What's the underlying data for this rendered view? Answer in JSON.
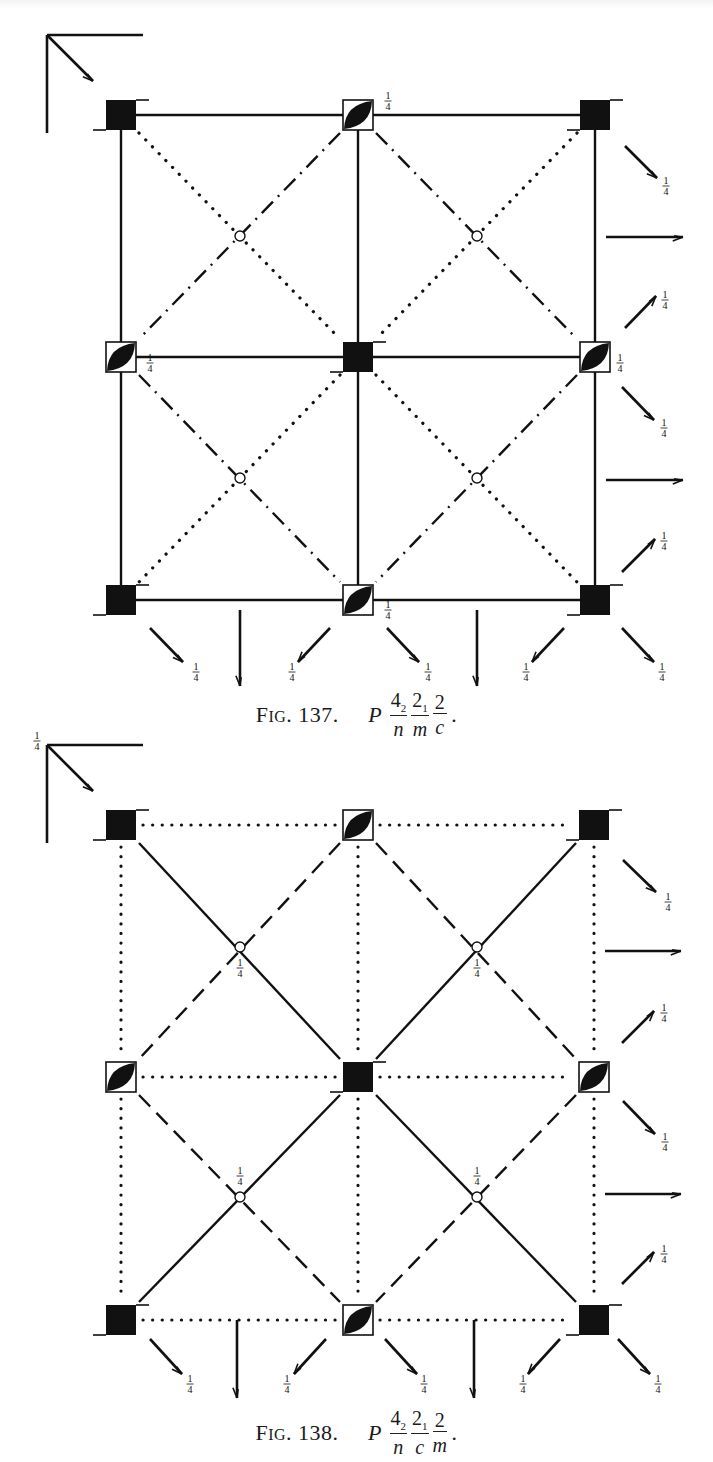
{
  "figures": [
    {
      "id": "fig137",
      "label_prefix": "F",
      "label_smallcaps": "IG",
      "label_number": ". 137.",
      "symbol": {
        "lattice": "P",
        "parts": [
          {
            "num": "4",
            "sub": "2",
            "den": "n"
          },
          {
            "num": "2",
            "sub": "1",
            "den": "m"
          },
          {
            "num": "2",
            "sub": "",
            "den": "c"
          }
        ],
        "trail": "."
      },
      "space_group": "P 4_2/n 2_1/m 2/c",
      "svg_top": 0,
      "caption_top": 690,
      "grid": {
        "xs": [
          121,
          358,
          595
        ],
        "ys": [
          115,
          357,
          600
        ]
      },
      "axis_origin": [
        47,
        35
      ],
      "axis_label": "",
      "boundary_style": "solid",
      "mid_style": "solid",
      "diag_main_style": "dotted",
      "diag_anti_style": "dashdot",
      "inversion_centers": [
        [
          240,
          236
        ],
        [
          477,
          236
        ],
        [
          240,
          478
        ],
        [
          477,
          478
        ]
      ],
      "inversion_labels": [],
      "diad_labels": [
        {
          "x": 388,
          "y": 101,
          "text": "1/4"
        },
        {
          "x": 150,
          "y": 363,
          "text": "1/4"
        },
        {
          "x": 620,
          "y": 363,
          "text": "1/4"
        },
        {
          "x": 388,
          "y": 610,
          "text": "1/4"
        }
      ],
      "side_arrows": [
        {
          "x1": 625,
          "y1": 146,
          "x2": 657,
          "y2": 178,
          "label": "1/4",
          "lx": 666,
          "ly": 186
        },
        {
          "x1": 606,
          "y1": 237,
          "x2": 683,
          "y2": 237,
          "label": "",
          "lx": 0,
          "ly": 0
        },
        {
          "x1": 625,
          "y1": 328,
          "x2": 656,
          "y2": 296,
          "label": "1/4",
          "lx": 665,
          "ly": 300
        },
        {
          "x1": 622,
          "y1": 387,
          "x2": 654,
          "y2": 420,
          "label": "1/4",
          "lx": 664,
          "ly": 428
        },
        {
          "x1": 606,
          "y1": 480,
          "x2": 683,
          "y2": 480,
          "label": "",
          "lx": 0,
          "ly": 0
        },
        {
          "x1": 622,
          "y1": 572,
          "x2": 655,
          "y2": 539,
          "label": "1/4",
          "lx": 664,
          "ly": 541
        }
      ],
      "bottom_arrows": [
        {
          "x1": 150,
          "y1": 628,
          "x2": 183,
          "y2": 662,
          "label": "1/4",
          "lx": 196,
          "ly": 672
        },
        {
          "x1": 240,
          "y1": 610,
          "x2": 240,
          "y2": 686,
          "label": "",
          "lx": 0,
          "ly": 0
        },
        {
          "x1": 330,
          "y1": 628,
          "x2": 298,
          "y2": 662,
          "label": "1/4",
          "lx": 292,
          "ly": 672
        },
        {
          "x1": 387,
          "y1": 628,
          "x2": 419,
          "y2": 662,
          "label": "1/4",
          "lx": 428,
          "ly": 672
        },
        {
          "x1": 477,
          "y1": 610,
          "x2": 477,
          "y2": 686,
          "label": "",
          "lx": 0,
          "ly": 0
        },
        {
          "x1": 564,
          "y1": 628,
          "x2": 532,
          "y2": 662,
          "label": "1/4",
          "lx": 526,
          "ly": 672
        },
        {
          "x1": 622,
          "y1": 628,
          "x2": 654,
          "y2": 662,
          "label": "1/4",
          "lx": 662,
          "ly": 672
        }
      ]
    },
    {
      "id": "fig138",
      "label_prefix": "F",
      "label_smallcaps": "IG",
      "label_number": ". 138.",
      "symbol": {
        "lattice": "P",
        "parts": [
          {
            "num": "4",
            "sub": "2",
            "den": "n"
          },
          {
            "num": "2",
            "sub": "1",
            "den": "c"
          },
          {
            "num": "2",
            "sub": "",
            "den": "m"
          }
        ],
        "trail": "."
      },
      "space_group": "P 4_2/n 2_1/c 2/m",
      "svg_top": 0,
      "caption_top": 1408,
      "grid": {
        "xs": [
          121,
          358,
          594
        ],
        "ys": [
          825,
          1077,
          1320
        ]
      },
      "axis_origin": [
        47,
        745
      ],
      "axis_label": "1/4",
      "boundary_style": "dotted",
      "mid_style": "dotted",
      "diag_main_style": "solid",
      "diag_anti_style": "dashed",
      "inversion_centers": [
        [
          240,
          947
        ],
        [
          477,
          947
        ],
        [
          240,
          1197
        ],
        [
          477,
          1197
        ]
      ],
      "inversion_labels": [
        {
          "x": 240,
          "y": 968,
          "text": "1/4"
        },
        {
          "x": 477,
          "y": 968,
          "text": "1/4"
        },
        {
          "x": 240,
          "y": 1176,
          "text": "1/4"
        },
        {
          "x": 477,
          "y": 1176,
          "text": "1/4"
        }
      ],
      "diad_labels": [],
      "side_arrows": [
        {
          "x1": 623,
          "y1": 860,
          "x2": 656,
          "y2": 892,
          "label": "1/4",
          "lx": 668,
          "ly": 902
        },
        {
          "x1": 605,
          "y1": 951,
          "x2": 681,
          "y2": 951,
          "label": "",
          "lx": 0,
          "ly": 0
        },
        {
          "x1": 622,
          "y1": 1043,
          "x2": 654,
          "y2": 1011,
          "label": "1/4",
          "lx": 664,
          "ly": 1013
        },
        {
          "x1": 623,
          "y1": 1101,
          "x2": 655,
          "y2": 1134,
          "label": "1/4",
          "lx": 665,
          "ly": 1142
        },
        {
          "x1": 605,
          "y1": 1194,
          "x2": 681,
          "y2": 1194,
          "label": "",
          "lx": 0,
          "ly": 0
        },
        {
          "x1": 622,
          "y1": 1284,
          "x2": 654,
          "y2": 1252,
          "label": "1/4",
          "lx": 664,
          "ly": 1254
        }
      ],
      "bottom_arrows": [
        {
          "x1": 150,
          "y1": 1339,
          "x2": 182,
          "y2": 1374,
          "label": "1/4",
          "lx": 190,
          "ly": 1384
        },
        {
          "x1": 237,
          "y1": 1320,
          "x2": 237,
          "y2": 1398,
          "label": "",
          "lx": 0,
          "ly": 0
        },
        {
          "x1": 326,
          "y1": 1339,
          "x2": 294,
          "y2": 1374,
          "label": "1/4",
          "lx": 287,
          "ly": 1384
        },
        {
          "x1": 385,
          "y1": 1339,
          "x2": 417,
          "y2": 1374,
          "label": "1/4",
          "lx": 424,
          "ly": 1384
        },
        {
          "x1": 474,
          "y1": 1320,
          "x2": 474,
          "y2": 1398,
          "label": "",
          "lx": 0,
          "ly": 0
        },
        {
          "x1": 560,
          "y1": 1339,
          "x2": 528,
          "y2": 1374,
          "label": "1/4",
          "lx": 523,
          "ly": 1384
        },
        {
          "x1": 618,
          "y1": 1339,
          "x2": 650,
          "y2": 1374,
          "label": "1/4",
          "lx": 658,
          "ly": 1384
        }
      ]
    }
  ],
  "symbols": {
    "tetrad": "filled-square-with-flags",
    "diad_center": "square-with-lens",
    "inversion_center": "small-open-circle"
  },
  "colors": {
    "ink": "#111111",
    "paper": "#ffffff"
  }
}
